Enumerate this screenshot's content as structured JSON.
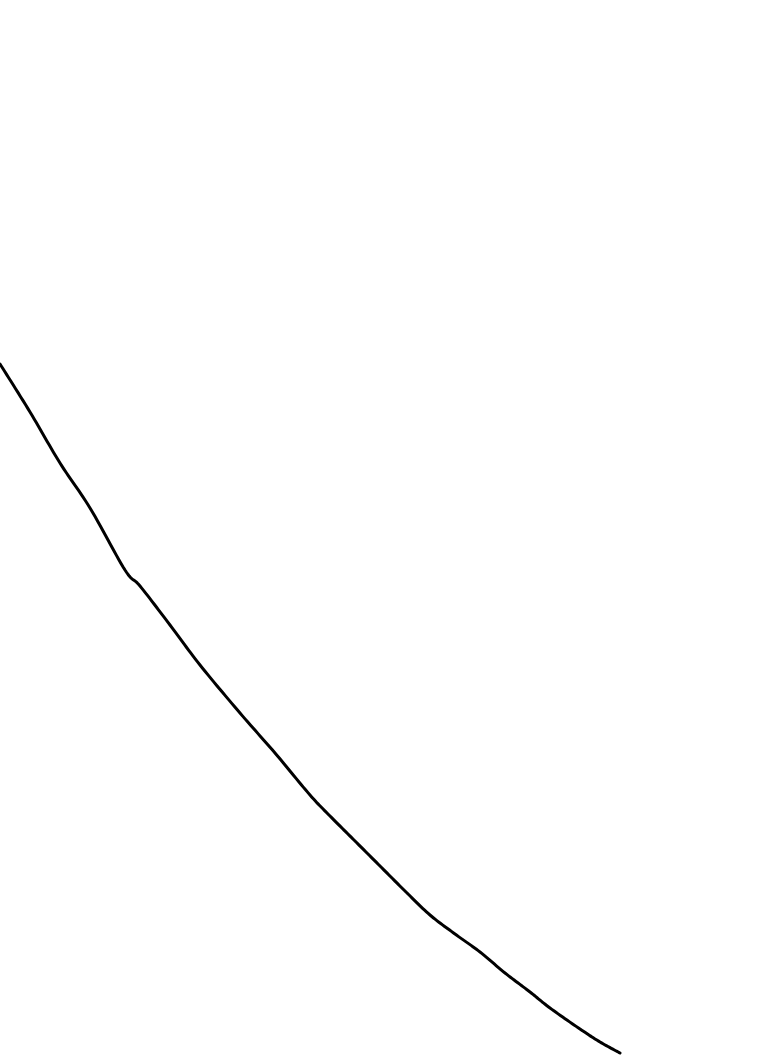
{
  "page": {
    "width": 760,
    "height": 1055,
    "background_color": "#ffffff"
  },
  "figure": {
    "name": "decreasing-curve",
    "stroke_color": "#000000",
    "stroke_width": 3,
    "fill": "none",
    "line_cap": "round",
    "line_join": "round"
  },
  "chart_data": {
    "type": "line",
    "title": "",
    "subtitle": "",
    "xlabel": "",
    "ylabel": "",
    "grid": false,
    "legend": null,
    "axes_visible": false,
    "tick_labels_x": [],
    "tick_labels_y": [],
    "annotations": [],
    "xlim": [
      0,
      760
    ],
    "ylim": [
      1055,
      0
    ],
    "series": [
      {
        "name": "curve",
        "color": "#000000",
        "shape": "smooth monotonically decreasing, concave-up (convex) curve",
        "points": [
          {
            "x": 0,
            "y": 364
          },
          {
            "x": 30,
            "y": 412
          },
          {
            "x": 60,
            "y": 463
          },
          {
            "x": 90,
            "y": 508
          },
          {
            "x": 125,
            "y": 570
          },
          {
            "x": 140,
            "y": 586
          },
          {
            "x": 170,
            "y": 625
          },
          {
            "x": 200,
            "y": 665
          },
          {
            "x": 240,
            "y": 713
          },
          {
            "x": 275,
            "y": 753
          },
          {
            "x": 310,
            "y": 795
          },
          {
            "x": 330,
            "y": 816
          },
          {
            "x": 355,
            "y": 841
          },
          {
            "x": 380,
            "y": 866
          },
          {
            "x": 405,
            "y": 891
          },
          {
            "x": 430,
            "y": 915
          },
          {
            "x": 455,
            "y": 934
          },
          {
            "x": 480,
            "y": 952
          },
          {
            "x": 505,
            "y": 973
          },
          {
            "x": 530,
            "y": 992
          },
          {
            "x": 550,
            "y": 1008
          },
          {
            "x": 580,
            "y": 1029
          },
          {
            "x": 600,
            "y": 1042
          },
          {
            "x": 620,
            "y": 1053
          }
        ]
      }
    ]
  }
}
